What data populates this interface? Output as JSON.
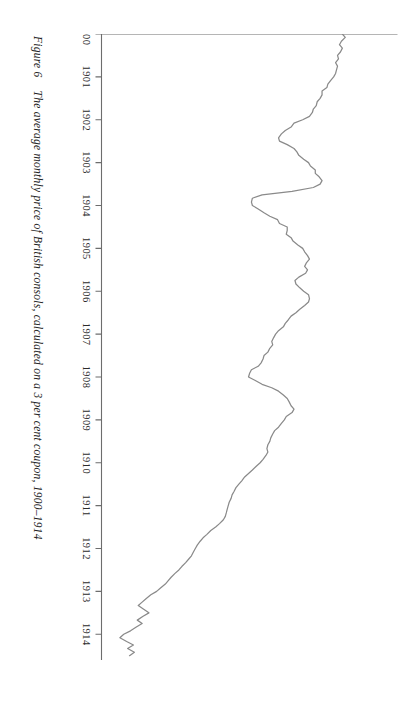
{
  "caption": {
    "figure_number": "Figure 6",
    "text": "The average monthly price of British consols, calculated on a 3 per cent coupon, 1900–1914"
  },
  "chart_data": {
    "type": "line",
    "title": "The average monthly price of British consols, calculated on a 3 per cent coupon, 1900–1914",
    "xlabel": "",
    "ylabel": "",
    "xlim": [
      1900,
      1914.6
    ],
    "ylim": [
      85,
      115.6
    ],
    "grid": false,
    "legend": "none",
    "orientation": "page-rotated-90-clockwise",
    "xticks": [
      "1900",
      "1901",
      "1902",
      "1903",
      "1904",
      "1905",
      "1906",
      "1907",
      "1908",
      "1909",
      "1910",
      "1911",
      "1912",
      "1913",
      "1914"
    ],
    "xtick_values": [
      1900,
      1901,
      1902,
      1903,
      1904,
      1905,
      1906,
      1907,
      1908,
      1909,
      1910,
      1911,
      1912,
      1913,
      1914
    ],
    "yticks": [
      "115",
      "110",
      "105",
      "100",
      "95",
      "90",
      "85"
    ],
    "ytick_values": [
      115,
      110,
      105,
      100,
      95,
      90,
      85
    ],
    "series": [
      {
        "name": "British consols (3% coupon) average monthly price",
        "color": "#8a8a8a",
        "x": [
          1900.0,
          1900.08,
          1900.17,
          1900.25,
          1900.33,
          1900.42,
          1900.5,
          1900.58,
          1900.67,
          1900.75,
          1900.83,
          1900.92,
          1901.0,
          1901.08,
          1901.17,
          1901.25,
          1901.33,
          1901.42,
          1901.5,
          1901.58,
          1901.67,
          1901.75,
          1901.83,
          1901.92,
          1902.0,
          1902.08,
          1902.17,
          1902.25,
          1902.33,
          1902.42,
          1902.5,
          1902.58,
          1902.67,
          1902.75,
          1902.83,
          1902.92,
          1903.0,
          1903.08,
          1903.17,
          1903.25,
          1903.33,
          1903.42,
          1903.5,
          1903.58,
          1903.67,
          1903.75,
          1903.83,
          1903.92,
          1904.0,
          1904.08,
          1904.17,
          1904.25,
          1904.33,
          1904.42,
          1904.5,
          1904.58,
          1904.67,
          1904.75,
          1904.83,
          1904.92,
          1905.0,
          1905.08,
          1905.17,
          1905.25,
          1905.33,
          1905.42,
          1905.5,
          1905.58,
          1905.67,
          1905.75,
          1905.83,
          1905.92,
          1906.0,
          1906.08,
          1906.17,
          1906.25,
          1906.33,
          1906.42,
          1906.5,
          1906.58,
          1906.67,
          1906.75,
          1906.83,
          1906.92,
          1907.0,
          1907.08,
          1907.17,
          1907.25,
          1907.33,
          1907.42,
          1907.5,
          1907.58,
          1907.67,
          1907.75,
          1907.83,
          1907.92,
          1908.0,
          1908.08,
          1908.17,
          1908.25,
          1908.33,
          1908.42,
          1908.5,
          1908.58,
          1908.67,
          1908.75,
          1908.83,
          1908.92,
          1909.0,
          1909.08,
          1909.17,
          1909.25,
          1909.33,
          1909.42,
          1909.5,
          1909.58,
          1909.67,
          1909.75,
          1909.83,
          1909.92,
          1910.0,
          1910.08,
          1910.17,
          1910.25,
          1910.33,
          1910.42,
          1910.5,
          1910.58,
          1910.67,
          1910.75,
          1910.83,
          1910.92,
          1911.0,
          1911.08,
          1911.17,
          1911.25,
          1911.33,
          1911.42,
          1911.5,
          1911.58,
          1911.67,
          1911.75,
          1911.83,
          1911.92,
          1912.0,
          1912.08,
          1912.17,
          1912.25,
          1912.33,
          1912.42,
          1912.5,
          1912.58,
          1912.67,
          1912.75,
          1912.83,
          1912.92,
          1913.0,
          1913.08,
          1913.17,
          1913.25,
          1913.33,
          1913.42,
          1913.5,
          1913.58,
          1913.67,
          1913.75,
          1913.83,
          1913.92,
          1914.0,
          1914.08,
          1914.17,
          1914.25,
          1914.33,
          1914.42,
          1914.5
        ],
        "y": [
          109.9,
          110.2,
          109.8,
          109.6,
          109.9,
          109.7,
          109.4,
          109.5,
          109.2,
          109.4,
          109.3,
          109.2,
          109.0,
          108.7,
          108.4,
          108.3,
          107.8,
          107.8,
          107.6,
          107.3,
          107.2,
          106.9,
          106.8,
          106.5,
          105.8,
          104.9,
          104.6,
          104.0,
          103.6,
          103.3,
          103.4,
          104.2,
          104.9,
          105.2,
          105.4,
          105.9,
          106.4,
          106.6,
          107.1,
          107.1,
          107.5,
          107.8,
          107.6,
          106.9,
          104.7,
          101.6,
          100.6,
          100.5,
          100.6,
          101.2,
          101.8,
          102.4,
          103.2,
          103.4,
          104.2,
          104.2,
          104.1,
          104.6,
          104.8,
          105.3,
          105.8,
          106.0,
          106.3,
          106.5,
          106.2,
          106.0,
          106.3,
          106.1,
          105.4,
          105.0,
          105.1,
          105.5,
          105.9,
          106.4,
          106.5,
          106.4,
          106.0,
          105.5,
          105.1,
          104.6,
          104.3,
          104.0,
          103.8,
          103.3,
          103.0,
          102.8,
          102.6,
          102.7,
          102.4,
          102.2,
          101.8,
          101.7,
          101.5,
          101.2,
          100.5,
          100.3,
          100.2,
          100.9,
          101.6,
          102.6,
          103.3,
          103.8,
          104.2,
          104.4,
          104.6,
          104.9,
          104.7,
          104.1,
          103.9,
          103.6,
          103.3,
          102.9,
          102.7,
          102.5,
          102.4,
          102.2,
          102.1,
          102.2,
          102.0,
          101.7,
          101.4,
          101.0,
          100.6,
          100.2,
          99.8,
          99.5,
          99.2,
          98.9,
          98.7,
          98.5,
          98.4,
          98.2,
          98.1,
          98.0,
          97.9,
          97.8,
          97.6,
          97.2,
          96.8,
          96.3,
          95.9,
          95.5,
          95.2,
          94.9,
          94.7,
          94.5,
          94.3,
          94.0,
          93.7,
          93.3,
          93.0,
          92.6,
          92.2,
          91.9,
          91.6,
          91.1,
          90.7,
          90.1,
          89.6,
          89.2,
          88.8,
          89.4,
          89.9,
          89.3,
          88.7,
          89.2,
          88.6,
          88.0,
          87.3,
          86.9,
          87.6,
          88.3,
          87.7,
          88.4,
          87.9
        ]
      }
    ]
  }
}
